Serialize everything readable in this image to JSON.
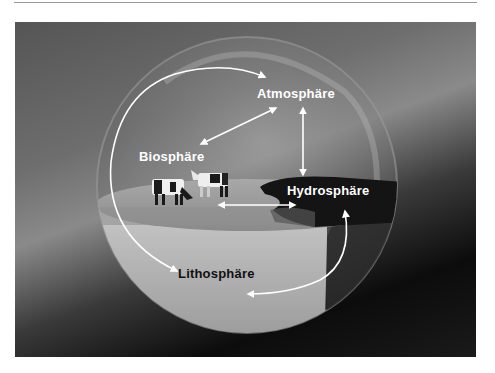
{
  "diagram": {
    "title": "",
    "nodes": [
      {
        "id": "atmosphere",
        "label": "Atmosphäre"
      },
      {
        "id": "biosphere",
        "label": "Biosphäre"
      },
      {
        "id": "hydrosphere",
        "label": "Hydrosphäre"
      },
      {
        "id": "lithosphere",
        "label": "Lithosphäre"
      }
    ],
    "edges": [
      {
        "from": "lithosphere",
        "to": "atmosphere",
        "style": "curved-arc-left",
        "direction": "bidirectional"
      },
      {
        "from": "atmosphere",
        "to": "biosphere",
        "direction": "bidirectional"
      },
      {
        "from": "atmosphere",
        "to": "hydrosphere",
        "direction": "bidirectional"
      },
      {
        "from": "biosphere",
        "to": "hydrosphere",
        "direction": "bidirectional"
      },
      {
        "from": "hydrosphere",
        "to": "lithosphere",
        "style": "curved-arc-right",
        "direction": "bidirectional"
      }
    ],
    "illustration": {
      "elements": [
        "glass-sphere",
        "grass-field",
        "two-cows",
        "water-pond",
        "earth-cross-section"
      ]
    }
  },
  "colors": {
    "label_light": "#ffffff",
    "label_dark": "#111111",
    "arrow": "#ffffff"
  }
}
